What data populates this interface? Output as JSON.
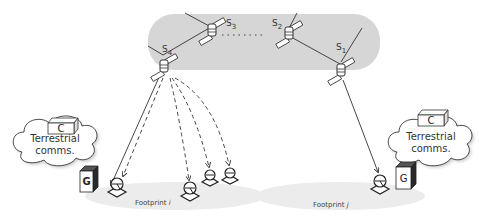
{
  "diagram": {
    "satellites": [
      {
        "id": "s1",
        "label": "S",
        "subscript": "1"
      },
      {
        "id": "s2",
        "label": "S",
        "subscript": "2"
      },
      {
        "id": "s3",
        "label": "S",
        "subscript": "3"
      },
      {
        "id": "s4",
        "label": "S",
        "subscript": "4"
      }
    ],
    "clouds": [
      {
        "id": "left",
        "line1": "Terrestrial",
        "line2": "comms."
      },
      {
        "id": "right",
        "line1": "Terrestrial",
        "line2": "comms."
      }
    ],
    "control_center_label": "C",
    "gateway_label": "G",
    "footprints": [
      {
        "id": "i",
        "label": "Footprint",
        "index": "i"
      },
      {
        "id": "j",
        "label": "Footprint",
        "index": "j"
      }
    ],
    "colors": {
      "orbit_band": "#d6d6d6",
      "footprint": "#ececec",
      "line": "#333333",
      "gateway_dark": "#2a2a2a"
    }
  }
}
